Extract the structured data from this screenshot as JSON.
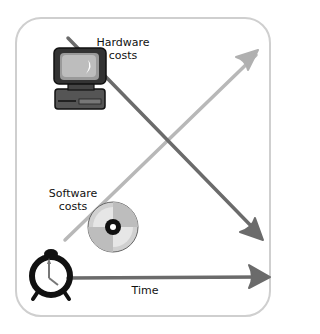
{
  "diagram": {
    "labels": {
      "hardware": "Hardware\ncosts",
      "hardware_line1": "Hardware",
      "hardware_line2": "costs",
      "software_line1": "Software",
      "software_line2": "costs",
      "time": "Time"
    },
    "icons": [
      "computer-icon",
      "cd-disc-icon",
      "alarm-clock-icon"
    ],
    "colors": {
      "hardware_arrow": "#6b6b6b",
      "software_arrow": "#b5b5b5",
      "time_arrow": "#6b6b6b",
      "frame": "#cfcfcf"
    },
    "arrows": {
      "hardware": "decreasing (top-left to bottom-right)",
      "software": "increasing (bottom-left to top-right)",
      "time": "horizontal (left to right)"
    }
  }
}
